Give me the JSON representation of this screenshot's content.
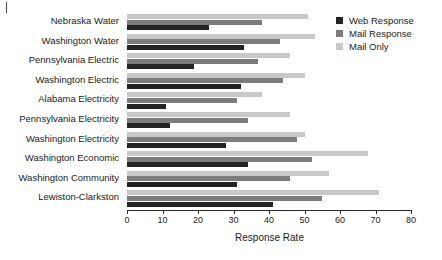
{
  "chart_data": {
    "type": "bar",
    "orientation": "horizontal",
    "title": "",
    "xlabel": "Response Rate",
    "ylabel": "",
    "xlim": [
      0,
      80
    ],
    "xticks": [
      0,
      10,
      20,
      30,
      40,
      50,
      60,
      70,
      80
    ],
    "grid": false,
    "legend_position": "top-right",
    "categories": [
      "Nebraska Water",
      "Washington Water",
      "Pennsylvania Electric",
      "Washington Electric",
      "Alabama Electricity",
      "Pennsylvania Electricity",
      "Washington Electricity",
      "Washington Economic",
      "Washington Community",
      "Lewiston-Clarkston"
    ],
    "series": [
      {
        "name": "Web Response",
        "color": "#232323",
        "values": [
          23,
          33,
          19,
          32,
          11,
          12,
          28,
          34,
          31,
          41
        ]
      },
      {
        "name": "Mail Response",
        "color": "#7c7c7c",
        "values": [
          38,
          43,
          37,
          44,
          31,
          34,
          48,
          52,
          46,
          55
        ]
      },
      {
        "name": "Mail Only",
        "color": "#c8c8c8",
        "values": [
          51,
          53,
          46,
          50,
          38,
          46,
          50,
          68,
          57,
          71
        ]
      }
    ]
  },
  "legend": {
    "items": [
      {
        "label": "Web Response",
        "color": "#232323",
        "swatch": "square-swatch"
      },
      {
        "label": "Mail Response",
        "color": "#7c7c7c",
        "swatch": "square-swatch"
      },
      {
        "label": "Mail Only",
        "color": "#c8c8c8",
        "swatch": "square-swatch"
      }
    ]
  }
}
